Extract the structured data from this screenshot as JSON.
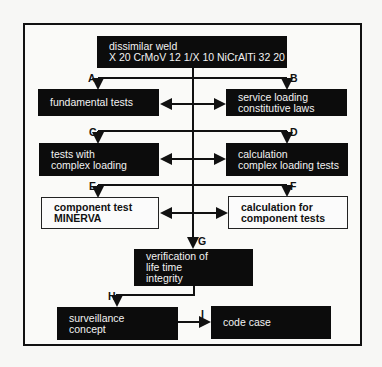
{
  "diagram": {
    "nodes": {
      "root": {
        "lines": [
          "dissimilar weld",
          "X 20 CrMoV 12 1/X 10 NiCrAlTi 32 20"
        ]
      },
      "fundamental": {
        "lines": [
          "fundamental tests"
        ]
      },
      "service": {
        "lines": [
          "service loading",
          "constitutive laws"
        ]
      },
      "tests_complex": {
        "lines": [
          "tests with",
          "complex loading"
        ]
      },
      "calc_complex": {
        "lines": [
          "calculation",
          "complex loading tests"
        ]
      },
      "component_test": {
        "lines": [
          "component test",
          "MINERVA"
        ]
      },
      "calc_component": {
        "lines": [
          "calculation for",
          "component tests"
        ]
      },
      "verification": {
        "lines": [
          "verification of",
          "life time",
          "integrity"
        ]
      },
      "surveillance": {
        "lines": [
          "surveillance",
          "concept"
        ]
      },
      "code_case": {
        "lines": [
          "code case"
        ]
      }
    },
    "labels": {
      "A": "A",
      "B": "B",
      "C": "C",
      "D": "D",
      "E": "E",
      "F": "F",
      "G": "G",
      "H": "H",
      "I": "I"
    },
    "edges": [
      {
        "from": "root",
        "to": "fundamental",
        "label": "A"
      },
      {
        "from": "root",
        "to": "service",
        "label": "B"
      },
      {
        "from": "fundamental",
        "to": "service",
        "type": "bidirectional"
      },
      {
        "from": "root",
        "to": "tests_complex",
        "label": "C"
      },
      {
        "from": "root",
        "to": "calc_complex",
        "label": "D"
      },
      {
        "from": "tests_complex",
        "to": "calc_complex",
        "type": "bidirectional"
      },
      {
        "from": "root",
        "to": "component_test",
        "label": "E"
      },
      {
        "from": "root",
        "to": "calc_component",
        "label": "F"
      },
      {
        "from": "component_test",
        "to": "calc_component",
        "type": "bidirectional"
      },
      {
        "from": "root",
        "to": "verification",
        "label": "G"
      },
      {
        "from": "verification",
        "to": "surveillance",
        "label": "H"
      },
      {
        "from": "surveillance",
        "to": "code_case",
        "label": "I"
      }
    ]
  },
  "colors": {
    "box_dark": "#0c0c0c",
    "box_text_light": "#f2f2f2",
    "line": "#111111",
    "background": "#f7f7f5"
  }
}
